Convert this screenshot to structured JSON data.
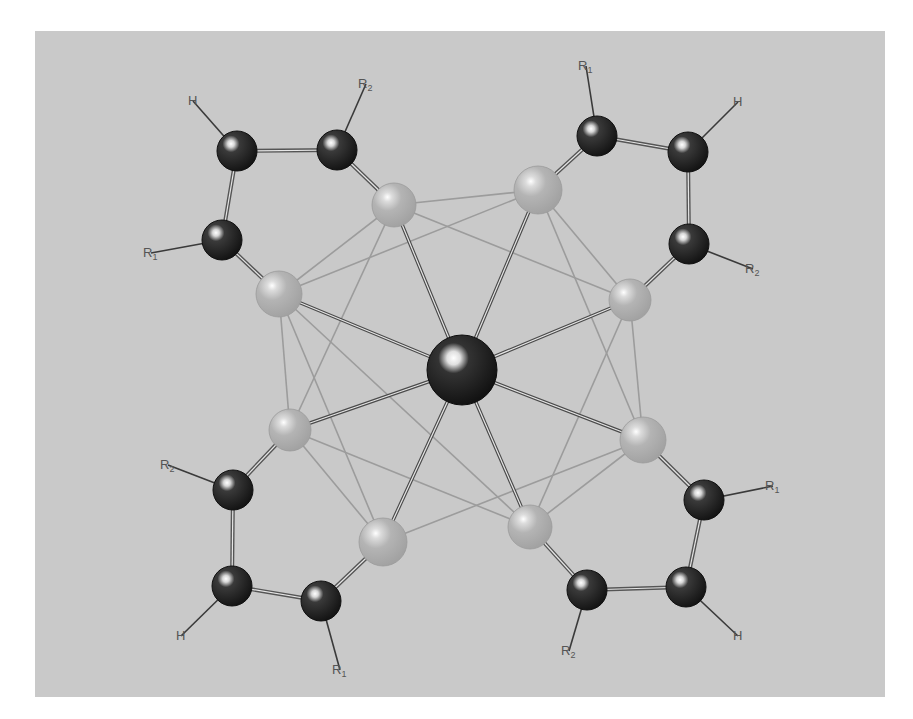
{
  "figure": {
    "background_color": "#c9c9c9",
    "central_atom": {
      "x": 462,
      "y": 370,
      "r": 35,
      "color": "#1a1a1a"
    },
    "donor_atoms": [
      {
        "id": "d1",
        "x": 394,
        "y": 205,
        "r": 22
      },
      {
        "id": "d2",
        "x": 538,
        "y": 190,
        "r": 24
      },
      {
        "id": "d3",
        "x": 279,
        "y": 294,
        "r": 23
      },
      {
        "id": "d4",
        "x": 630,
        "y": 300,
        "r": 21
      },
      {
        "id": "d5",
        "x": 290,
        "y": 430,
        "r": 21
      },
      {
        "id": "d6",
        "x": 643,
        "y": 440,
        "r": 23
      },
      {
        "id": "d7",
        "x": 383,
        "y": 542,
        "r": 24
      },
      {
        "id": "d8",
        "x": 530,
        "y": 527,
        "r": 22
      }
    ],
    "ligands": [
      {
        "name": "ligand-top-left",
        "atoms": [
          {
            "x": 237,
            "y": 151,
            "label": "H",
            "sub": "",
            "lx": 188,
            "ly": 105
          },
          {
            "x": 337,
            "y": 150,
            "label": "R",
            "sub": "2",
            "lx": 358,
            "ly": 88
          },
          {
            "x": 222,
            "y": 240,
            "label": "R",
            "sub": "1",
            "lx": 143,
            "ly": 257
          }
        ]
      },
      {
        "name": "ligand-top-right",
        "atoms": [
          {
            "x": 597,
            "y": 136,
            "label": "R",
            "sub": "1",
            "lx": 578,
            "ly": 70
          },
          {
            "x": 688,
            "y": 152,
            "label": "H",
            "sub": "",
            "lx": 733,
            "ly": 106
          },
          {
            "x": 689,
            "y": 244,
            "label": "R",
            "sub": "2",
            "lx": 745,
            "ly": 273
          }
        ]
      },
      {
        "name": "ligand-bottom-left",
        "atoms": [
          {
            "x": 233,
            "y": 490,
            "label": "R",
            "sub": "2",
            "lx": 160,
            "ly": 469
          },
          {
            "x": 232,
            "y": 586,
            "label": "H",
            "sub": "",
            "lx": 176,
            "ly": 640
          },
          {
            "x": 321,
            "y": 601,
            "label": "R",
            "sub": "1",
            "lx": 332,
            "ly": 674
          }
        ]
      },
      {
        "name": "ligand-bottom-right",
        "atoms": [
          {
            "x": 704,
            "y": 500,
            "label": "R",
            "sub": "1",
            "lx": 765,
            "ly": 490
          },
          {
            "x": 686,
            "y": 587,
            "label": "H",
            "sub": "",
            "lx": 733,
            "ly": 640
          },
          {
            "x": 587,
            "y": 590,
            "label": "R",
            "sub": "2",
            "lx": 561,
            "ly": 655
          }
        ]
      }
    ]
  }
}
